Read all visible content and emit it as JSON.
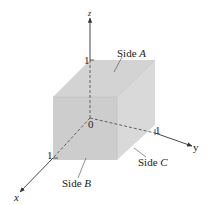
{
  "diagram": {
    "type": "unit-cube-3d-axes",
    "axes": {
      "x": {
        "label": "x",
        "tick": "1"
      },
      "y": {
        "label": "y",
        "tick": "1"
      },
      "z": {
        "label": "z",
        "tick": "1"
      },
      "origin": "0"
    },
    "faces": {
      "a": {
        "prefix": "Side ",
        "letter": "A"
      },
      "b": {
        "prefix": "Side ",
        "letter": "B"
      },
      "c": {
        "prefix": "Side ",
        "letter": "C"
      }
    },
    "colors": {
      "top_face": "#d4d4d4",
      "front_face": "#cfcfcf",
      "right_face": "#dadada",
      "axis": "#333333"
    }
  }
}
